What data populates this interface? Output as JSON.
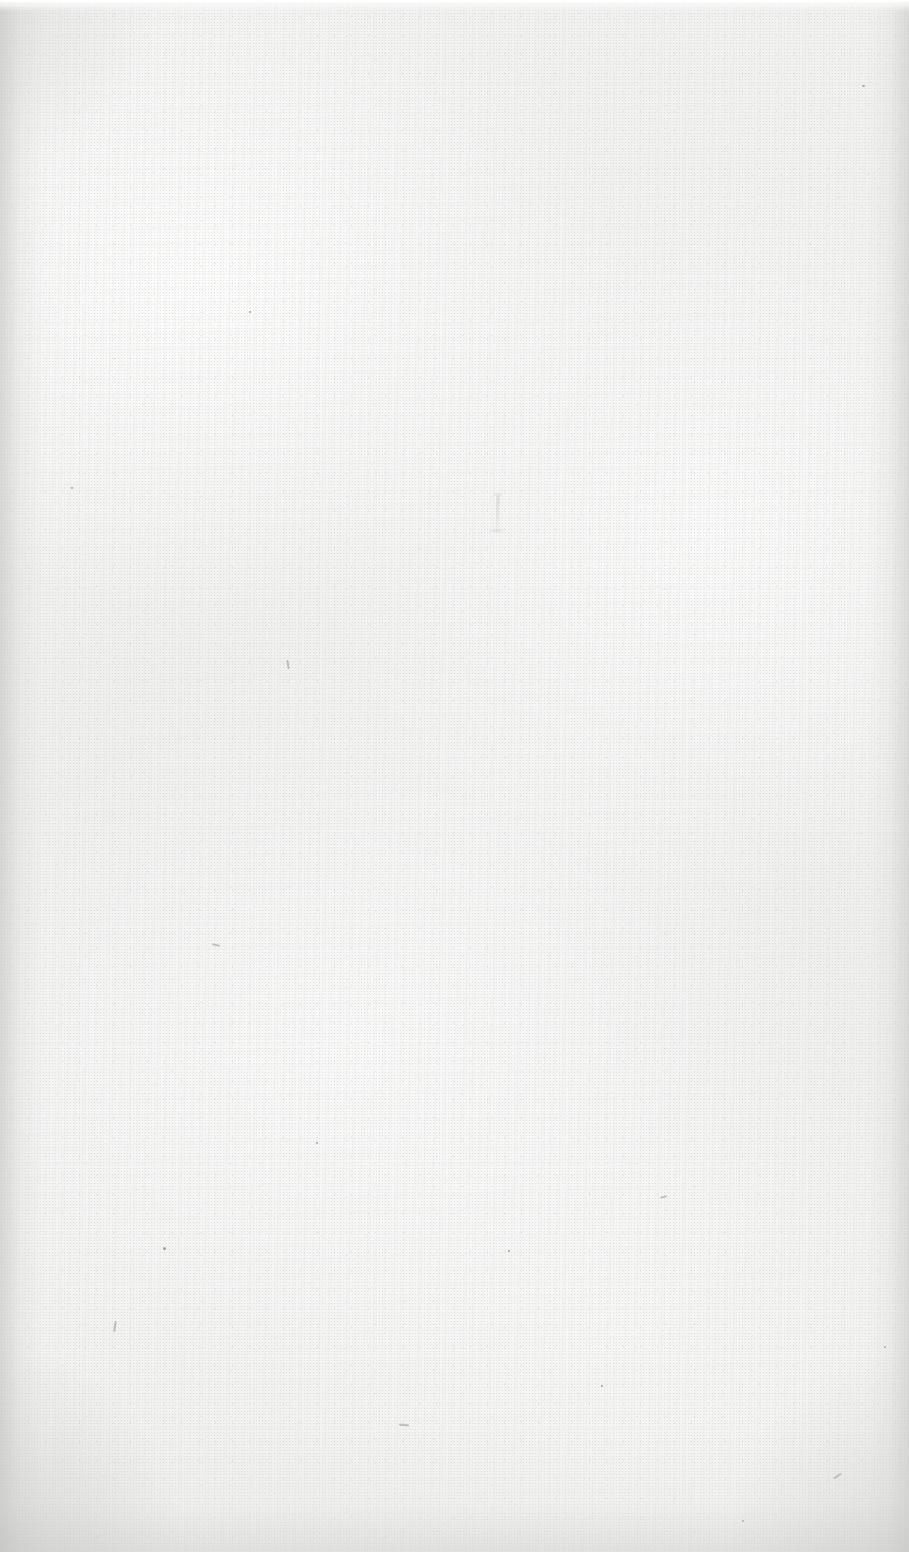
{
  "document": {
    "kind": "scanned-page",
    "page_state": "blank",
    "visible_text": "",
    "page_number": "",
    "heading": "",
    "caption": ""
  },
  "canvas": {
    "width_px": 909,
    "height_px": 1552
  },
  "paper": {
    "base_color": "#f2f2f1",
    "highlight_color": "#fdfdfd",
    "shadow_color": "#c4c4c2",
    "speck_color": "#60605e",
    "fibre_color": "#787876",
    "showthrough_color": "#a4a4a4"
  },
  "artifacts": {
    "top_edge_band_label": "",
    "left_vignette_label": "",
    "right_vignette_label": "",
    "bottom_vignette_label": "",
    "showthrough_mark_label": ""
  }
}
